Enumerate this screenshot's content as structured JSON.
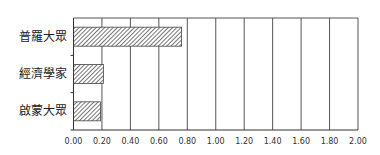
{
  "chart_data": {
    "type": "bar",
    "orientation": "horizontal",
    "title": "",
    "xlabel": "",
    "ylabel": "",
    "categories": [
      "普羅大眾",
      "經濟學家",
      "啟蒙大眾"
    ],
    "values": [
      0.76,
      0.21,
      0.19
    ],
    "xlim": [
      0,
      2.0
    ],
    "xticks": [
      "0.00",
      "0.20",
      "0.40",
      "0.60",
      "0.80",
      "1.00",
      "1.20",
      "1.40",
      "1.60",
      "1.80",
      "2.00"
    ],
    "grid": "vertical",
    "legend": null,
    "bar_fill": "diagonal-hatch",
    "colors": {
      "bar_fill": "#9a9a9a",
      "axis": "#333333",
      "grid": "#555555"
    }
  }
}
